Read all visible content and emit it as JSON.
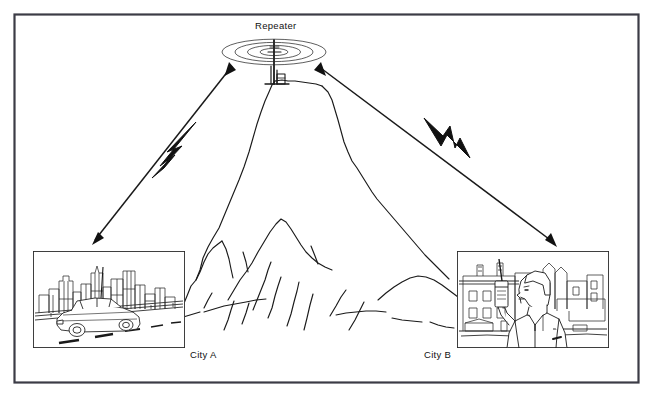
{
  "figure": {
    "type": "line-art-diagram",
    "background_color": "#ffffff",
    "ink_color": "#1a1a1a",
    "border": {
      "color": "#3c3c46",
      "x": 14,
      "y": 14,
      "width": 624,
      "height": 368
    }
  },
  "labels": {
    "repeater": "Repeater",
    "city_a": "City A",
    "city_b": "City B"
  },
  "repeater": {
    "antenna_icon": "antenna-tower-icon",
    "radiation_rings": 4,
    "center_x": 274,
    "center_y": 52
  },
  "panels": [
    {
      "id": "city-a",
      "label": "City A",
      "caption_x": 190,
      "caption_y": 349,
      "x": 33,
      "y": 251,
      "width": 152,
      "height": 97,
      "scene": "mobile-radio-car-on-highway-with-skyline",
      "contents": [
        "city-skyline",
        "highway",
        "sedan-car",
        "whip-antenna",
        "lane-markings"
      ]
    },
    {
      "id": "city-b",
      "label": "City B",
      "caption_x": 424,
      "caption_y": 349,
      "x": 457,
      "y": 251,
      "width": 152,
      "height": 97,
      "scene": "person-using-handheld-radio-in-street",
      "contents": [
        "apartment-building",
        "city-buildings",
        "person",
        "handheld-radio"
      ]
    }
  ],
  "links": [
    {
      "id": "link-a",
      "from": "City A",
      "to": "Repeater",
      "style": "bidirectional-arrow",
      "rf_symbol": "lightning-bolt-icon",
      "bolt_x": 175,
      "bolt_y": 150
    },
    {
      "id": "link-b",
      "from": "Repeater",
      "to": "City B",
      "style": "bidirectional-arrow",
      "rf_symbol": "lightning-bolt-icon",
      "bolt_x": 452,
      "bolt_y": 145
    }
  ],
  "mountain": {
    "icon": "mountain-icon",
    "peak_x": 274,
    "peak_y": 80,
    "base_y": 330
  }
}
